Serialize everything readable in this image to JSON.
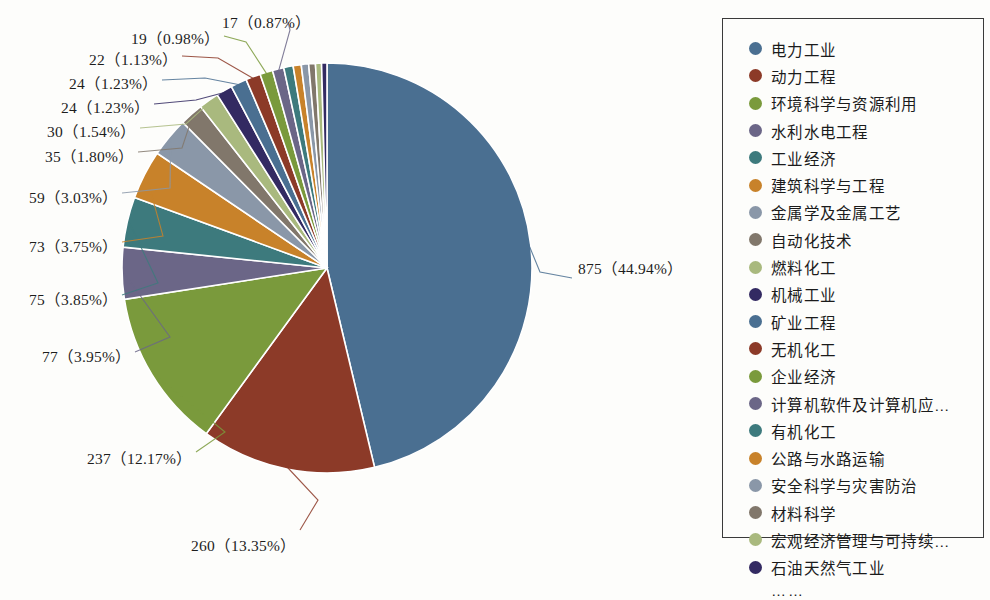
{
  "chart_data": {
    "type": "pie",
    "title": "",
    "total": 1947,
    "value_format": "{count} ({percent}%)",
    "legend_position": "right",
    "legend_truncation_marker": "……",
    "categories": [
      "电力工业",
      "动力工程",
      "环境科学与资源利用",
      "水利水电工程",
      "工业经济",
      "建筑科学与工程",
      "金属学及金属工艺",
      "自动化技术",
      "燃料化工",
      "机械工业",
      "矿业工程",
      "无机化工",
      "企业经济",
      "计算机软件及计算机应…",
      "有机化工",
      "公路与水路运输",
      "安全科学与灾害防治",
      "材料科学",
      "宏观经济管理与可持续…",
      "石油天然气工业"
    ],
    "values": [
      875,
      260,
      237,
      77,
      75,
      73,
      59,
      35,
      30,
      24,
      24,
      22,
      19,
      17,
      14,
      12,
      11,
      10,
      9,
      8
    ],
    "labeled_slices": [
      {
        "index": 0,
        "count": 875,
        "percent": "44.94",
        "label": "875（44.94%）",
        "side": "right"
      },
      {
        "index": 1,
        "count": 260,
        "percent": "13.35",
        "label": "260（13.35%）",
        "side": "bottom"
      },
      {
        "index": 2,
        "count": 237,
        "percent": "12.17",
        "label": "237（12.17%）",
        "side": "left"
      },
      {
        "index": 3,
        "count": 77,
        "percent": "3.95",
        "label": "77（3.95%）",
        "side": "left"
      },
      {
        "index": 4,
        "count": 75,
        "percent": "3.85",
        "label": "75（3.85%）",
        "side": "left"
      },
      {
        "index": 5,
        "count": 73,
        "percent": "3.75",
        "label": "73（3.75%）",
        "side": "left"
      },
      {
        "index": 6,
        "count": 59,
        "percent": "3.03",
        "label": "59（3.03%）",
        "side": "left"
      },
      {
        "index": 7,
        "count": 35,
        "percent": "1.80",
        "label": "35（1.80%）",
        "side": "left"
      },
      {
        "index": 8,
        "count": 30,
        "percent": "1.54",
        "label": "30（1.54%）",
        "side": "left"
      },
      {
        "index": 9,
        "count": 24,
        "percent": "1.23",
        "label": "24（1.23%）",
        "side": "left"
      },
      {
        "index": 10,
        "count": 24,
        "percent": "1.23",
        "label": "24（1.23%）",
        "side": "left"
      },
      {
        "index": 11,
        "count": 22,
        "percent": "1.13",
        "label": "22（1.13%）",
        "side": "left"
      },
      {
        "index": 12,
        "count": 19,
        "percent": "0.98",
        "label": "19（0.98%）",
        "side": "left"
      },
      {
        "index": 13,
        "count": 17,
        "percent": "0.87",
        "label": "17（0.87%）",
        "side": "top"
      }
    ],
    "colors": [
      "#4a6f91",
      "#8c3a28",
      "#7a9a3c",
      "#6b6687",
      "#3d7a7d",
      "#c8822a",
      "#8a97a8",
      "#81776b",
      "#a9b97e",
      "#332a62"
    ]
  },
  "legend": {
    "items": [
      {
        "label": "电力工业",
        "color": "#4a6f91"
      },
      {
        "label": "动力工程",
        "color": "#8c3a28"
      },
      {
        "label": "环境科学与资源利用",
        "color": "#7a9a3c"
      },
      {
        "label": "水利水电工程",
        "color": "#6b6687"
      },
      {
        "label": "工业经济",
        "color": "#3d7a7d"
      },
      {
        "label": "建筑科学与工程",
        "color": "#c8822a"
      },
      {
        "label": "金属学及金属工艺",
        "color": "#8a97a8"
      },
      {
        "label": "自动化技术",
        "color": "#81776b"
      },
      {
        "label": "燃料化工",
        "color": "#a9b97e"
      },
      {
        "label": "机械工业",
        "color": "#332a62"
      },
      {
        "label": "矿业工程",
        "color": "#4a6f91"
      },
      {
        "label": "无机化工",
        "color": "#8c3a28"
      },
      {
        "label": "企业经济",
        "color": "#7a9a3c"
      },
      {
        "label": "计算机软件及计算机应…",
        "color": "#6b6687"
      },
      {
        "label": "有机化工",
        "color": "#3d7a7d"
      },
      {
        "label": "公路与水路运输",
        "color": "#c8822a"
      },
      {
        "label": "安全科学与灾害防治",
        "color": "#8a97a8"
      },
      {
        "label": "材料科学",
        "color": "#81776b"
      },
      {
        "label": "宏观经济管理与可持续…",
        "color": "#a9b97e"
      },
      {
        "label": "石油天然气工业",
        "color": "#332a62"
      }
    ],
    "ellipsis": "……"
  },
  "labels": {
    "l_875": "875（44.94%）",
    "l_260": "260（13.35%）",
    "l_237": "237（12.17%）",
    "l_77": "77（3.95%）",
    "l_75": "75（3.85%）",
    "l_73": "73（3.75%）",
    "l_59": "59（3.03%）",
    "l_35": "35（1.80%）",
    "l_30": "30（1.54%）",
    "l_24a": "24（1.23%）",
    "l_24b": "24（1.23%）",
    "l_22": "22（1.13%）",
    "l_19": "19（0.98%）",
    "l_17": "17（0.87%）"
  }
}
